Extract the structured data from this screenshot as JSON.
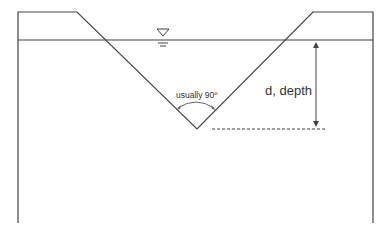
{
  "diagram": {
    "labels": {
      "angle": "usually 90",
      "angle_superscript": "o",
      "depth": "d, depth"
    },
    "colors": {
      "stroke": "#444444",
      "text": "#333333",
      "background": "#ffffff"
    },
    "symbols": {
      "water_surface": "inverted-triangle-water-level-icon"
    }
  }
}
